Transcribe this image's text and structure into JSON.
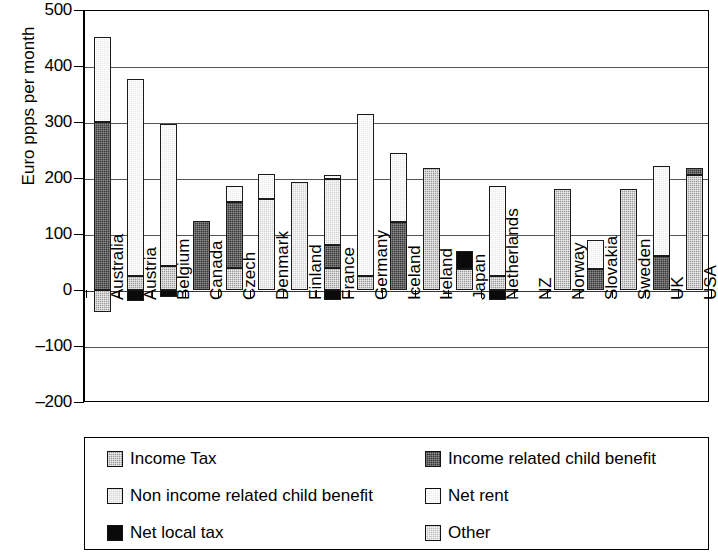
{
  "chart_data": {
    "type": "bar",
    "stacked": true,
    "title": "",
    "xlabel": "",
    "ylabel": "Euro ppps per month",
    "ylim": [
      -200,
      500
    ],
    "ytick_step": 100,
    "yticks": [
      "500",
      "400",
      "300",
      "200",
      "100",
      "0",
      "-100",
      "-200"
    ],
    "grid": true,
    "grid_axis": "y",
    "legend_position": "bottom",
    "categories": [
      "Australia",
      "Austria",
      "Belgium",
      "Canada",
      "Czech",
      "Denmark",
      "Finland",
      "France",
      "Germany",
      "Iceland",
      "Ireland",
      "Japan",
      "Netherlands",
      "NZ",
      "Norway",
      "Slovakia",
      "Sweden",
      "UK",
      "USA"
    ],
    "series": [
      {
        "name": "Income Tax",
        "key": "income_tax",
        "color": "#9a9a9a",
        "values": [
          -40,
          25,
          43,
          0,
          40,
          0,
          0,
          40,
          25,
          0,
          217,
          38,
          25,
          0,
          180,
          0,
          180,
          0,
          205
        ]
      },
      {
        "name": "Income related child benefit",
        "key": "income_related_child_benefit",
        "color": "#3a3a3a",
        "values": [
          300,
          0,
          0,
          123,
          117,
          0,
          0,
          40,
          0,
          122,
          0,
          0,
          0,
          0,
          0,
          38,
          0,
          60,
          12
        ]
      },
      {
        "name": "Non income related child benefit",
        "key": "non_income_related_child_benefit",
        "color": "#d2d2d2",
        "values": [
          0,
          0,
          0,
          0,
          0,
          162,
          193,
          118,
          0,
          0,
          0,
          0,
          0,
          0,
          0,
          0,
          0,
          0,
          0
        ]
      },
      {
        "name": "Net rent",
        "key": "net_rent",
        "color": "#ececec",
        "values": [
          152,
          352,
          254,
          0,
          28,
          45,
          0,
          7,
          290,
          122,
          0,
          0,
          160,
          0,
          0,
          52,
          0,
          162,
          0
        ]
      },
      {
        "name": "Net local tax",
        "key": "net_local_tax",
        "color": "#0a0a0a",
        "values": [
          0,
          -20,
          -12,
          0,
          0,
          0,
          0,
          -18,
          0,
          0,
          0,
          32,
          -18,
          0,
          0,
          0,
          0,
          0,
          0
        ]
      },
      {
        "name": "Other",
        "key": "other",
        "color": "#bfbfbf",
        "values": [
          0,
          0,
          0,
          0,
          0,
          0,
          0,
          0,
          0,
          0,
          0,
          0,
          0,
          0,
          0,
          0,
          0,
          0,
          0
        ]
      }
    ],
    "totals_positive": [
      452,
      377,
      297,
      123,
      185,
      207,
      193,
      205,
      315,
      244,
      217,
      70,
      185,
      0,
      180,
      90,
      180,
      222,
      217
    ],
    "totals_negative": [
      -40,
      -20,
      -12,
      0,
      0,
      0,
      0,
      -18,
      0,
      0,
      0,
      0,
      -18,
      0,
      0,
      0,
      0,
      0,
      0
    ]
  },
  "axis": {
    "y_title": "Euro ppps per month"
  },
  "legend": {
    "items": [
      {
        "label": "Income Tax",
        "fill": "f-income-tax",
        "icon": "legend-swatch-income-tax"
      },
      {
        "label": "Income related child benefit",
        "fill": "f-inc-child",
        "icon": "legend-swatch-income-related-child-benefit"
      },
      {
        "label": "Non income related child benefit",
        "fill": "f-noninc-child",
        "icon": "legend-swatch-non-income-related-child-benefit"
      },
      {
        "label": "Net rent",
        "fill": "f-net-rent",
        "icon": "legend-swatch-net-rent"
      },
      {
        "label": "Net local tax",
        "fill": "f-net-local",
        "icon": "legend-swatch-net-local-tax"
      },
      {
        "label": "Other",
        "fill": "f-other",
        "icon": "legend-swatch-other"
      }
    ]
  }
}
